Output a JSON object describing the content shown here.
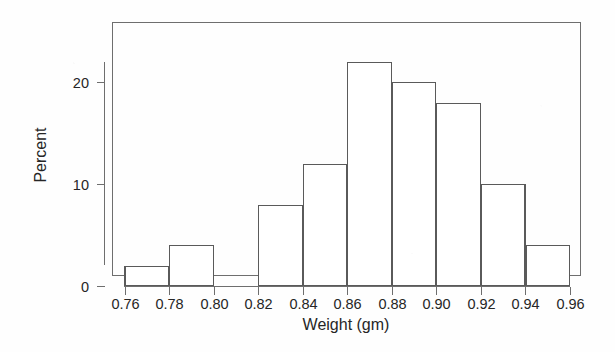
{
  "chart_data": {
    "type": "bar",
    "title": "",
    "subtitle": "",
    "xlabel": "Weight (gm)",
    "ylabel": "Percent",
    "categories": [
      "0.76-0.78",
      "0.78-0.80",
      "0.80-0.82",
      "0.82-0.84",
      "0.84-0.86",
      "0.86-0.88",
      "0.88-0.90",
      "0.90-0.92",
      "0.92-0.94",
      "0.94-0.96"
    ],
    "bin_edges": [
      0.76,
      0.78,
      0.8,
      0.82,
      0.84,
      0.86,
      0.88,
      0.9,
      0.92,
      0.94,
      0.96
    ],
    "values": [
      2,
      4,
      0,
      8,
      12,
      22,
      20,
      18,
      10,
      4
    ],
    "bin_width": 0.02,
    "xlim": [
      0.76,
      0.96
    ],
    "ylim": [
      0,
      23
    ],
    "xticks": [
      0.76,
      0.78,
      0.8,
      0.82,
      0.84,
      0.86,
      0.88,
      0.9,
      0.92,
      0.94,
      0.96
    ],
    "xtick_labels": [
      "0.76",
      "0.78",
      "0.80",
      "0.82",
      "0.84",
      "0.86",
      "0.88",
      "0.90",
      "0.92",
      "0.94",
      "0.96"
    ],
    "yticks": [
      0,
      10,
      20
    ],
    "ytick_labels": [
      "0",
      "10",
      "20"
    ],
    "grid": false,
    "legend": false,
    "legend_position": "none",
    "bar_fill_color": "#ffffff",
    "bar_stroke_color": "#5a5a5a",
    "axis_color": "#6e6e6e",
    "background_color": "#fefefe"
  },
  "axes": {
    "y_title": "Percent",
    "x_title": "Weight (gm)"
  }
}
